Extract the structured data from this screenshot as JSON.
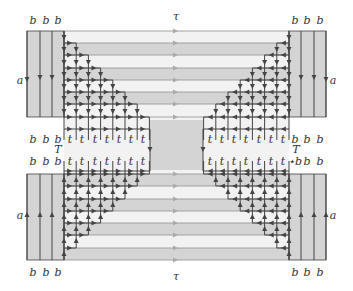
{
  "figure": {
    "type": "lattice-diagram",
    "labels": {
      "top_tau": "τ",
      "bottom_tau": "τ",
      "a_left_top": "a",
      "a_right_top": "a",
      "a_left_bottom": "a",
      "a_right_bottom": "a",
      "T_left": "T",
      "T_right": "T",
      "b": "b",
      "t": "t",
      "star": "⋆"
    },
    "top_b_labels": [
      "b",
      "b",
      "b",
      "b",
      "b",
      "b"
    ],
    "bottom_b_labels": [
      "b",
      "b",
      "b",
      "b",
      "b",
      "b"
    ],
    "mid_upper_row": [
      "b",
      "b",
      "b",
      "t",
      "t",
      "t",
      "t",
      "t",
      "t",
      "t",
      "t",
      "t",
      "t",
      "t",
      "t",
      "t",
      "t",
      "b",
      "b",
      "b"
    ],
    "mid_lower_row": [
      "b",
      "b",
      "b",
      "t",
      "t",
      "t",
      "t",
      "t",
      "t",
      "t",
      "t",
      "t",
      "t",
      "t",
      "t",
      "t",
      "t",
      "⋆b",
      "b",
      "b"
    ],
    "colors": {
      "band": "#d4d4d4",
      "band_light": "#f2f2f2",
      "line": "#444444",
      "hline": "#9a9a9a",
      "arrow_gray": "#aaaaaa"
    }
  }
}
